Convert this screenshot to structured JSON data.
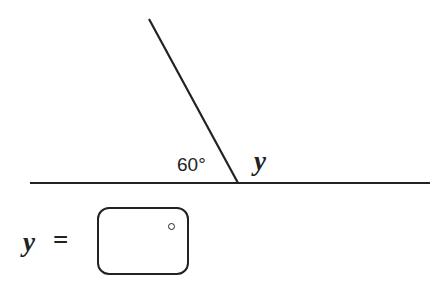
{
  "diagram": {
    "given_angle": "60°",
    "unknown_angle": "y",
    "colors": {
      "line": "#222222",
      "background": "#ffffff"
    }
  },
  "answer": {
    "variable": "y",
    "equals": "=",
    "input_value": "",
    "unit": "°"
  }
}
